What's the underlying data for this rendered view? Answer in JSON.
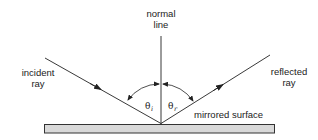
{
  "diagram": {
    "labels": {
      "normal_line": [
        "normal",
        "line"
      ],
      "incident_ray": [
        "incident",
        "ray"
      ],
      "reflected_ray": [
        "reflected",
        "ray"
      ],
      "surface": "mirrored surface",
      "angle_incidence": {
        "symbol": "θ",
        "subscript": "i"
      },
      "angle_reflection": {
        "symbol": "θ",
        "subscript": "r"
      }
    },
    "colors": {
      "line": "#222222",
      "surface_fill": "#d9d9d9",
      "surface_stroke": "#333333"
    }
  }
}
